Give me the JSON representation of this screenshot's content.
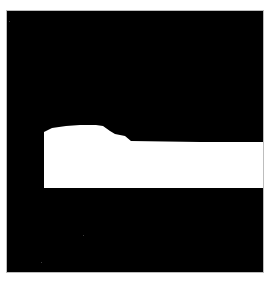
{
  "image": {
    "kind": "binary-segmentation-mask",
    "width": 270,
    "height": 282,
    "colors": {
      "page_background": "#ffffff",
      "mask_background": "#000000",
      "mask_foreground": "#ffffff",
      "frame_border": "#bdbdbd"
    },
    "mask_region": {
      "x": 6,
      "y": 10,
      "width": 258,
      "height": 263
    },
    "foreground_polygon": [
      [
        44,
        132
      ],
      [
        52,
        128
      ],
      [
        66,
        126
      ],
      [
        80,
        125
      ],
      [
        96,
        125
      ],
      [
        103,
        126
      ],
      [
        110,
        131
      ],
      [
        115,
        134
      ],
      [
        125,
        136
      ],
      [
        131,
        141
      ],
      [
        200,
        142
      ],
      [
        263,
        142
      ],
      [
        263,
        188
      ],
      [
        44,
        188
      ]
    ]
  }
}
